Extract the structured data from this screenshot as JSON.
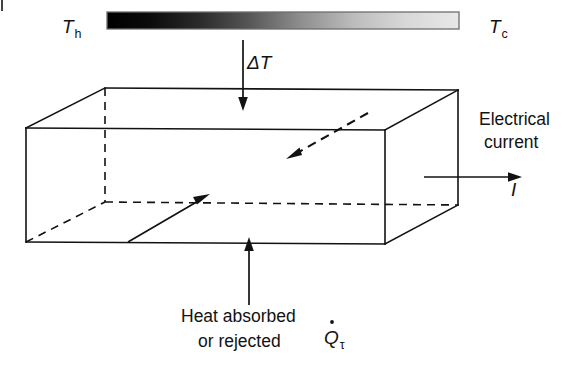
{
  "figure": {
    "background_color": "#ffffff",
    "line_color": "#121212"
  },
  "gradient_bar": {
    "name": "temperature-gradient-bar",
    "hot_end_color": "#000000",
    "cold_end_color": "#e8e8e8",
    "border_color": "#6e6e6e",
    "x": 107,
    "y": 12,
    "width": 352,
    "height": 17
  },
  "labels": {
    "hot_side": {
      "symbol": "T",
      "subscript": "h",
      "x": 62,
      "y": 33
    },
    "cold_side": {
      "symbol": "T",
      "subscript": "c",
      "x": 489,
      "y": 33
    },
    "delta_t": {
      "text": "ΔT",
      "x": 247,
      "y": 69
    },
    "electrical_current_line1": {
      "text": "Electrical",
      "x": 479,
      "y": 125
    },
    "electrical_current_line2": {
      "text": "current",
      "x": 484,
      "y": 148
    },
    "current_symbol": {
      "text": "I",
      "x": 511,
      "y": 196
    },
    "heat_line1": {
      "text": "Heat absorbed",
      "x": 181,
      "y": 322
    },
    "heat_line2": {
      "text": "or rejected",
      "x": 198,
      "y": 347
    },
    "thomson_heat": {
      "symbol": "Q",
      "subscript": "τ",
      "has_dot": true,
      "x": 324,
      "y": 344
    }
  },
  "box": {
    "name": "conductor-block",
    "front_top_left": [
      26,
      128
    ],
    "front_top_right": [
      385,
      130
    ],
    "front_bottom_left": [
      26,
      242
    ],
    "front_bottom_right": [
      385,
      244
    ],
    "back_top_left": [
      105,
      88
    ],
    "back_top_right": [
      458,
      90
    ],
    "back_bottom_left": [
      105,
      202
    ],
    "back_bottom_right": [
      458,
      205
    ]
  },
  "arrows": {
    "delta_t_arrow": {
      "name": "delta-t-arrow",
      "direction": "down",
      "from": [
        243,
        40
      ],
      "to": [
        243,
        110
      ]
    },
    "current_arrow": {
      "name": "electrical-current-arrow",
      "direction": "right",
      "from": [
        424,
        177
      ],
      "to": [
        521,
        177
      ]
    },
    "heat_arrow": {
      "name": "heat-flow-arrow",
      "direction": "up",
      "from": [
        249,
        305
      ],
      "to": [
        249,
        238
      ]
    },
    "internal_solid_arrow": {
      "name": "carrier-flow-arrow-solid",
      "direction": "up-right",
      "from": [
        128,
        242
      ],
      "to": [
        208,
        196
      ]
    },
    "internal_dashed_arrow": {
      "name": "heat-conduction-arrow-dashed",
      "direction": "down-left",
      "from": [
        368,
        113
      ],
      "to": [
        288,
        158
      ]
    }
  }
}
